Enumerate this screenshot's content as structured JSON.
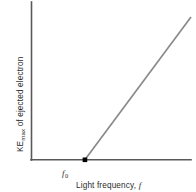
{
  "chart_data": {
    "type": "line",
    "title": "",
    "subtitle": "",
    "xlabel": "Light frequency, f",
    "xlabel_main": "Light frequency,",
    "xlabel_var": "f",
    "ylabel": "KEmax of ejected electron",
    "ylabel_prefix": "KE",
    "ylabel_subscript": "max",
    "ylabel_suffix": " of ejected electron",
    "x_tick_labels": [
      "f0"
    ],
    "x_tick_label_main": "f",
    "x_tick_label_sub": "0",
    "y_tick_labels": [],
    "grid": false,
    "legend": false,
    "legend_position": "none",
    "xlim": [
      0,
      10
    ],
    "ylim": [
      0,
      10
    ],
    "series": [
      {
        "name": "KEmax vs frequency",
        "x": [
          3.35,
          10.0
        ],
        "y": [
          0.0,
          9.05
        ],
        "color": "#8a8a8a",
        "description": "Straight line of positive slope beginning at threshold frequency f0 on the horizontal axis and rising to the upper right"
      }
    ],
    "annotations": [
      {
        "name": "threshold-point",
        "label": "f0",
        "x": 3.35,
        "y": 0.0,
        "marker": "square",
        "color": "#000000"
      }
    ],
    "axis_color": "#58595b",
    "background_color": "#ffffff"
  },
  "figure": {
    "accent_color": "#8a8a8a",
    "axis_color": "#58595b",
    "marker_color": "#000000",
    "background_color": "#ffffff"
  }
}
